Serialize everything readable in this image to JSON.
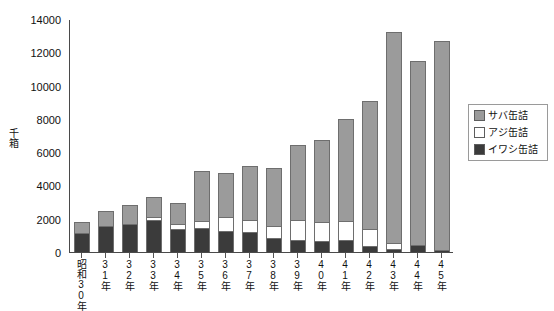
{
  "chart_data": {
    "type": "bar",
    "stacked": true,
    "title": "",
    "xlabel": "",
    "ylabel": "千箱",
    "ylim": [
      0,
      14000
    ],
    "ytick_step": 2000,
    "yticks": [
      0,
      2000,
      4000,
      6000,
      8000,
      10000,
      12000,
      14000
    ],
    "ytick_labels": [
      "0",
      "2000",
      "4000",
      "6000",
      "8000",
      "10000",
      "12000",
      "14000"
    ],
    "grid": false,
    "legend_position": "right",
    "categories": [
      "昭和30年",
      "31年",
      "32年",
      "33年",
      "34年",
      "35年",
      "36年",
      "37年",
      "38年",
      "39年",
      "40年",
      "41年",
      "42年",
      "43年",
      "44年",
      "45年"
    ],
    "series": [
      {
        "name": "イワシ缶詰",
        "color": "#3b3b3b",
        "stack_order": 0,
        "values": [
          1150,
          1550,
          1700,
          1950,
          1400,
          1450,
          1250,
          1200,
          850,
          700,
          650,
          700,
          350,
          200,
          400,
          150
        ]
      },
      {
        "name": "アジ缶詰",
        "color": "#ffffff",
        "stack_order": 1,
        "values": [
          0,
          0,
          0,
          150,
          300,
          400,
          850,
          750,
          700,
          1200,
          1150,
          1150,
          1050,
          350,
          0,
          0
        ]
      },
      {
        "name": "サバ缶詰",
        "color": "#9b9b9b",
        "stack_order": 2,
        "values": [
          650,
          900,
          1150,
          1200,
          1250,
          3000,
          2650,
          3200,
          3500,
          4550,
          4950,
          6150,
          7700,
          12650,
          11050,
          12500
        ]
      }
    ],
    "totals": [
      1800,
      2450,
      2850,
      3300,
      2950,
      4850,
      4750,
      5150,
      5050,
      6450,
      6750,
      8000,
      9100,
      13200,
      11450,
      12650
    ]
  },
  "legend": {
    "items": [
      {
        "label": "サバ缶詰",
        "swatch": "saba"
      },
      {
        "label": "アジ缶詰",
        "swatch": "aji"
      },
      {
        "label": "イワシ缶詰",
        "swatch": "iwashi"
      }
    ]
  }
}
